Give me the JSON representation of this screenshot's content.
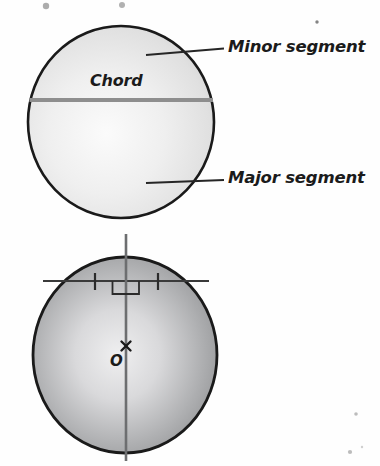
{
  "figure": {
    "colors": {
      "page_background": "#fefefe",
      "outline": "#1a1a1a",
      "chord_line": "#8e8e8e",
      "top_circle_fill_light": "#f2f2f2",
      "top_circle_fill_dark": "#d2d2d2",
      "bottom_circle_fill_light": "#ececed",
      "bottom_circle_fill_dark": "#8f9092",
      "label_text": "#1b1b1b",
      "artifact_gray": "#a9a9a9"
    }
  },
  "top_diagram": {
    "name": "chord-and-segments",
    "circle": {
      "cx": 121,
      "cy": 122,
      "rx": 93,
      "ry": 96
    },
    "chord": {
      "label": "Chord",
      "y": 100,
      "x1": 29,
      "x2": 213
    },
    "labels": {
      "minor_segment": "Minor segment",
      "major_segment": "Major segment"
    },
    "leaders": [
      {
        "name": "minor-segment-leader",
        "x1": 147,
        "y1": 55,
        "x2": 222,
        "y2": 49
      },
      {
        "name": "major-segment-leader",
        "x1": 147,
        "y1": 182,
        "x2": 222,
        "y2": 180
      }
    ]
  },
  "bottom_diagram": {
    "name": "perpendicular-from-centre-to-chord",
    "circle": {
      "cx": 125,
      "cy": 355,
      "rx": 92,
      "ry": 98
    },
    "centre": {
      "label": "O",
      "marker": "x",
      "x": 126,
      "y": 346
    },
    "vertical_line": {
      "x": 126,
      "y1": 234,
      "y2": 461
    },
    "chord": {
      "y": 281,
      "x1": 43,
      "x2": 208
    },
    "right_angle_marker": {
      "x": 112,
      "y": 281,
      "size": 13
    },
    "tick_marks": [
      {
        "name": "tick-left",
        "x": 95,
        "y": 281
      },
      {
        "name": "tick-right",
        "x": 158,
        "y": 281
      }
    ]
  },
  "artifacts": [
    {
      "name": "scan-speck-top-left",
      "x": 46,
      "y": 6,
      "r": 3.2
    },
    {
      "name": "scan-speck-top-right",
      "x": 122,
      "y": 5,
      "r": 3.0
    },
    {
      "name": "scan-speck-upper-right",
      "x": 317,
      "y": 22,
      "r": 1.6
    },
    {
      "name": "scan-speck-lower-right-a",
      "x": 356,
      "y": 414,
      "r": 1.8
    },
    {
      "name": "scan-speck-lower-right-b",
      "x": 350,
      "y": 452,
      "r": 2.1
    }
  ]
}
